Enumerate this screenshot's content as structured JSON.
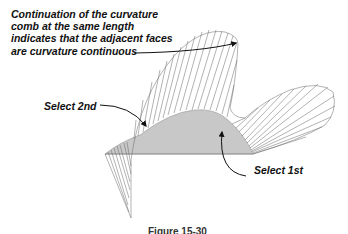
{
  "annotations": {
    "note_lines": [
      "Continuation of the curvature",
      "comb at the same length",
      "indicates that the adjacent faces",
      "are curvature continuous"
    ],
    "select_second": "Select 2nd",
    "select_first": "Select 1st"
  },
  "caption": "Figure 15-30",
  "colors": {
    "surface_fill": "#c8c8c8",
    "comb_line": "#555555",
    "arrow": "#111111",
    "text": "#111111"
  }
}
